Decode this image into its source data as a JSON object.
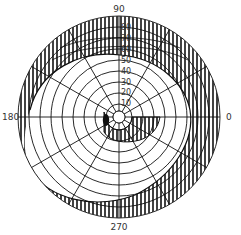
{
  "diagram": {
    "type": "polar-shading-mask",
    "center": {
      "x": 119,
      "y": 117
    },
    "outer_radius": 101,
    "axis_labels": {
      "top": "90",
      "left": "180",
      "right": "0",
      "bottom": "270"
    },
    "ring_labels": [
      "10",
      "20",
      "30",
      "40",
      "50",
      "60",
      "70",
      "80"
    ],
    "ring_count": 9,
    "radial_spacing_deg": 30,
    "colors": {
      "line": "#111111",
      "background": "#ffffff",
      "label": "#333333"
    },
    "regions": [
      {
        "name": "outer-hatched-crescent",
        "description": "vertically hatched shaded band along outer rim, widest on right side"
      },
      {
        "name": "inner-hatched-sector",
        "description": "small hatched sector below and right of center"
      },
      {
        "name": "solid-marker",
        "description": "small filled black blob left of center"
      }
    ]
  }
}
